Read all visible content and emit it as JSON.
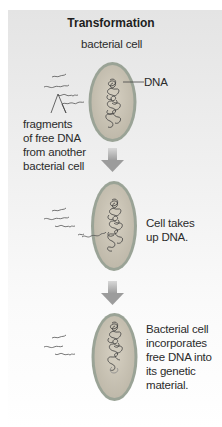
{
  "figure": {
    "title": "Transformation",
    "labels": {
      "cell_label": "bacterial cell",
      "dna_label": "DNA",
      "fragments_label": [
        "fragments",
        "of free DNA",
        "from another",
        "bacterial cell"
      ],
      "step2_caption": [
        "Cell takes",
        "up DNA."
      ],
      "step3_caption": [
        "Bacterial cell",
        "incorporates",
        "free DNA into",
        "its genetic",
        "material."
      ]
    },
    "colors": {
      "cell_fill": "#c9c3b4",
      "cell_border": "#8f9a8c",
      "arrow": "#a8a8a8",
      "dna_strand": "#4a4a4a"
    },
    "steps": 3
  }
}
